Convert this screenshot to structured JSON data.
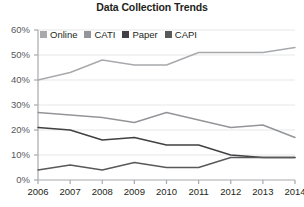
{
  "chart_data": {
    "type": "line",
    "title": "Data Collection Trends",
    "xlabel": "",
    "ylabel": "",
    "categories": [
      "2006",
      "2007",
      "2008",
      "2009",
      "2010",
      "2011",
      "2012",
      "2013",
      "2014"
    ],
    "x": [
      2006,
      2007,
      2008,
      2009,
      2010,
      2011,
      2012,
      2013,
      2014
    ],
    "ylim": [
      0,
      60
    ],
    "ytick_labels": [
      "0%",
      "10%",
      "20%",
      "30%",
      "40%",
      "50%",
      "60%"
    ],
    "ytick_values": [
      0,
      10,
      20,
      30,
      40,
      50,
      60
    ],
    "grid": true,
    "legend_position": "top-left",
    "series": [
      {
        "name": "Online",
        "color": "#a7a9ac",
        "values": [
          40,
          43,
          48,
          46,
          46,
          51,
          51,
          51,
          53
        ]
      },
      {
        "name": "CATI",
        "color": "#939598",
        "values": [
          27,
          26,
          25,
          23,
          27,
          24,
          21,
          22,
          17
        ]
      },
      {
        "name": "Paper",
        "color": "#414042",
        "values": [
          21,
          20,
          16,
          17,
          14,
          14,
          10,
          9,
          9
        ]
      },
      {
        "name": "CAPI",
        "color": "#58595b",
        "values": [
          4,
          6,
          4,
          7,
          5,
          5,
          9,
          9,
          9
        ]
      }
    ]
  },
  "axis": {
    "line_color": "#a7a9ac",
    "grid_color": "#e6e7e8"
  }
}
